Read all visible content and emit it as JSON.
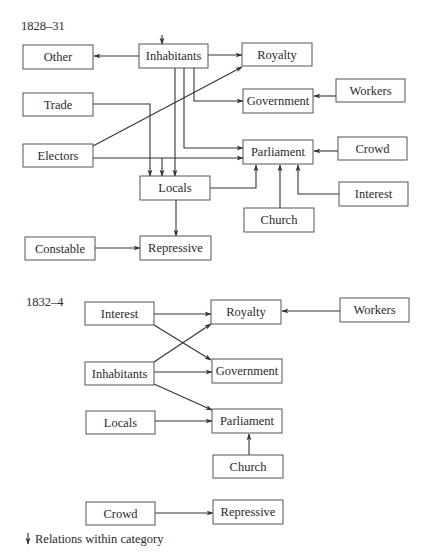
{
  "diagrams": [
    {
      "id": "d1",
      "label": "1828–31",
      "nodes": [
        {
          "id": "other",
          "label": "Other"
        },
        {
          "id": "inhabitants",
          "label": "Inhabitants"
        },
        {
          "id": "royalty",
          "label": "Royalty"
        },
        {
          "id": "trade",
          "label": "Trade"
        },
        {
          "id": "government",
          "label": "Government"
        },
        {
          "id": "workers",
          "label": "Workers"
        },
        {
          "id": "electors",
          "label": "Electors"
        },
        {
          "id": "parliament",
          "label": "Parliament"
        },
        {
          "id": "crowd",
          "label": "Crowd"
        },
        {
          "id": "locals",
          "label": "Locals"
        },
        {
          "id": "interest",
          "label": "Interest"
        },
        {
          "id": "church",
          "label": "Church"
        },
        {
          "id": "constable",
          "label": "Constable"
        },
        {
          "id": "repressive",
          "label": "Repressive"
        }
      ],
      "edges": [
        {
          "from": "inhabitants",
          "to": "inhabitants",
          "kind": "within-category"
        },
        {
          "from": "inhabitants",
          "to": "other"
        },
        {
          "from": "inhabitants",
          "to": "royalty"
        },
        {
          "from": "inhabitants",
          "to": "government"
        },
        {
          "from": "inhabitants",
          "to": "parliament"
        },
        {
          "from": "inhabitants",
          "to": "locals",
          "note": "two parallel lines"
        },
        {
          "from": "electors",
          "to": "royalty"
        },
        {
          "from": "electors",
          "to": "parliament"
        },
        {
          "from": "trade",
          "to": "locals"
        },
        {
          "from": "workers",
          "to": "government"
        },
        {
          "from": "crowd",
          "to": "parliament"
        },
        {
          "from": "locals",
          "to": "parliament"
        },
        {
          "from": "church",
          "to": "parliament"
        },
        {
          "from": "interest",
          "to": "parliament"
        },
        {
          "from": "locals",
          "to": "repressive"
        },
        {
          "from": "constable",
          "to": "repressive"
        }
      ]
    },
    {
      "id": "d2",
      "label": "1832–4",
      "nodes": [
        {
          "id": "interest",
          "label": "Interest"
        },
        {
          "id": "royalty",
          "label": "Royalty"
        },
        {
          "id": "workers",
          "label": "Workers"
        },
        {
          "id": "inhabitants",
          "label": "Inhabitants"
        },
        {
          "id": "government",
          "label": "Government"
        },
        {
          "id": "locals",
          "label": "Locals"
        },
        {
          "id": "parliament",
          "label": "Parliament"
        },
        {
          "id": "church",
          "label": "Church"
        },
        {
          "id": "crowd",
          "label": "Crowd"
        },
        {
          "id": "repressive",
          "label": "Repressive"
        }
      ],
      "edges": [
        {
          "from": "interest",
          "to": "royalty"
        },
        {
          "from": "interest",
          "to": "government"
        },
        {
          "from": "workers",
          "to": "royalty"
        },
        {
          "from": "inhabitants",
          "to": "royalty"
        },
        {
          "from": "inhabitants",
          "to": "government"
        },
        {
          "from": "inhabitants",
          "to": "parliament"
        },
        {
          "from": "locals",
          "to": "parliament"
        },
        {
          "from": "church",
          "to": "parliament"
        },
        {
          "from": "crowd",
          "to": "repressive"
        }
      ]
    }
  ],
  "legend": {
    "icon": "down-arrow-icon",
    "text": "Relations within category"
  }
}
